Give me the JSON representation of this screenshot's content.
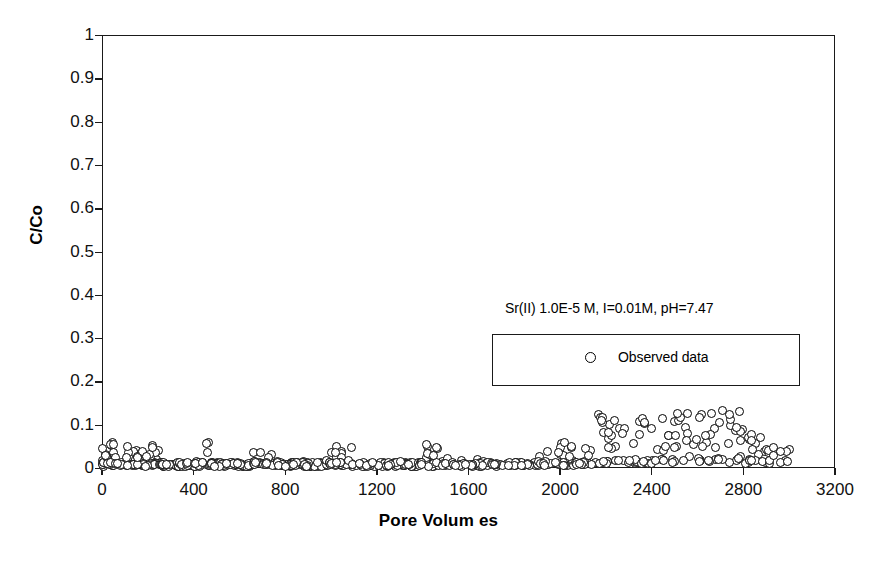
{
  "chart_data": {
    "type": "scatter",
    "title": "",
    "xlabel": "Pore Volum es",
    "ylabel": "C/Co",
    "xlim": [
      0,
      3200
    ],
    "ylim": [
      0,
      1
    ],
    "grid": false,
    "legend_position": "inside-right",
    "annotation": "Sr(II) 1.0E-5 M, I=0.01M, pH=7.47",
    "xticks": [
      0,
      400,
      800,
      1200,
      1600,
      2000,
      2400,
      2800,
      3200
    ],
    "xtick_labels": [
      "0",
      "400",
      "800",
      "1200",
      "1600",
      "2000",
      "2400",
      "2800",
      "3200"
    ],
    "yticks": [
      0,
      0.1,
      0.2,
      0.3,
      0.4,
      0.5,
      0.6,
      0.7,
      0.8,
      0.9,
      1
    ],
    "ytick_labels": [
      "0",
      "0.1",
      "0.2",
      "0.3",
      "0.4",
      "0.5",
      "0.6",
      "0.7",
      "0.8",
      "0.9",
      "1"
    ],
    "series": [
      {
        "name": "Observed data",
        "marker": "open-circle",
        "marker_color": "#000000",
        "marker_fill": "#ffffff",
        "n_points": 620,
        "description": "Breakthrough curve: C/Co stays near 0 from 0 to about 2000 pore volumes with sparse scatter up to 0.07, then rises to a plateau of roughly 0.02-0.13 between 2150 and 3000 pore volumes.",
        "segments": [
          {
            "x_start": 0,
            "x_end": 60,
            "count": 34,
            "y_base": 0.004,
            "y_spread": 0.055,
            "tail_fraction": 0.45
          },
          {
            "x_start": 60,
            "x_end": 260,
            "count": 78,
            "y_base": 0.004,
            "y_spread": 0.05,
            "tail_fraction": 0.32
          },
          {
            "x_start": 260,
            "x_end": 440,
            "count": 56,
            "y_base": 0.003,
            "y_spread": 0.012,
            "tail_fraction": 0.1
          },
          {
            "x_start": 440,
            "x_end": 470,
            "count": 6,
            "y_base": 0.004,
            "y_spread": 0.06,
            "tail_fraction": 0.4
          },
          {
            "x_start": 470,
            "x_end": 660,
            "count": 54,
            "y_base": 0.003,
            "y_spread": 0.012,
            "tail_fraction": 0.08
          },
          {
            "x_start": 660,
            "x_end": 760,
            "count": 30,
            "y_base": 0.004,
            "y_spread": 0.045,
            "tail_fraction": 0.3
          },
          {
            "x_start": 760,
            "x_end": 980,
            "count": 58,
            "y_base": 0.003,
            "y_spread": 0.014,
            "tail_fraction": 0.1
          },
          {
            "x_start": 980,
            "x_end": 1120,
            "count": 40,
            "y_base": 0.004,
            "y_spread": 0.048,
            "tail_fraction": 0.32
          },
          {
            "x_start": 1120,
            "x_end": 1380,
            "count": 62,
            "y_base": 0.003,
            "y_spread": 0.014,
            "tail_fraction": 0.1
          },
          {
            "x_start": 1380,
            "x_end": 1520,
            "count": 38,
            "y_base": 0.004,
            "y_spread": 0.05,
            "tail_fraction": 0.3
          },
          {
            "x_start": 1520,
            "x_end": 1900,
            "count": 74,
            "y_base": 0.003,
            "y_spread": 0.016,
            "tail_fraction": 0.12
          },
          {
            "x_start": 1900,
            "x_end": 2060,
            "count": 32,
            "y_base": 0.005,
            "y_spread": 0.055,
            "tail_fraction": 0.32
          },
          {
            "x_start": 2060,
            "x_end": 2160,
            "count": 20,
            "y_base": 0.006,
            "y_spread": 0.04,
            "tail_fraction": 0.35
          },
          {
            "x_start": 2160,
            "x_end": 2300,
            "count": 26,
            "y_base": 0.01,
            "y_spread": 0.115,
            "tail_fraction": 0.6
          },
          {
            "x_start": 2300,
            "x_end": 2450,
            "count": 24,
            "y_base": 0.01,
            "y_spread": 0.105,
            "tail_fraction": 0.58
          },
          {
            "x_start": 2450,
            "x_end": 2620,
            "count": 28,
            "y_base": 0.012,
            "y_spread": 0.115,
            "tail_fraction": 0.62
          },
          {
            "x_start": 2620,
            "x_end": 2800,
            "count": 30,
            "y_base": 0.012,
            "y_spread": 0.12,
            "tail_fraction": 0.64
          },
          {
            "x_start": 2800,
            "x_end": 2930,
            "count": 22,
            "y_base": 0.01,
            "y_spread": 0.075,
            "tail_fraction": 0.55
          },
          {
            "x_start": 2930,
            "x_end": 3000,
            "count": 8,
            "y_base": 0.008,
            "y_spread": 0.045,
            "tail_fraction": 0.45
          }
        ]
      }
    ]
  },
  "legend": {
    "entries": [
      {
        "label": "Observed data",
        "marker": "open-circle"
      }
    ]
  },
  "axes": {
    "x_title": "Pore Volum es",
    "y_title": "C/Co"
  }
}
